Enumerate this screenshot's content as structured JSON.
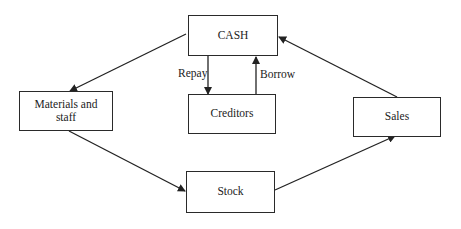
{
  "nodes": {
    "cash": "CASH",
    "creditors": "Creditors",
    "materials": "Materials and staff",
    "stock": "Stock",
    "sales": "Sales"
  },
  "edges": [
    {
      "from": "cash",
      "to": "materials",
      "label": ""
    },
    {
      "from": "materials",
      "to": "stock",
      "label": ""
    },
    {
      "from": "stock",
      "to": "sales",
      "label": ""
    },
    {
      "from": "sales",
      "to": "cash",
      "label": ""
    },
    {
      "from": "cash",
      "to": "creditors",
      "label": "Repay"
    },
    {
      "from": "creditors",
      "to": "cash",
      "label": "Borrow"
    }
  ],
  "labels": {
    "repay": "Repay",
    "borrow": "Borrow"
  }
}
